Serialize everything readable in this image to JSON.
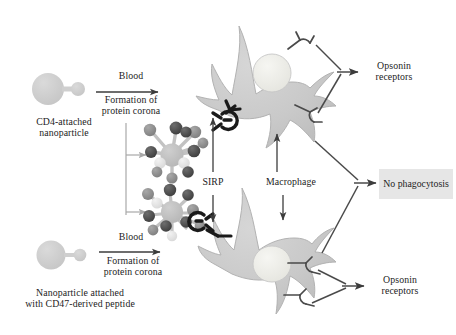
{
  "figure": {
    "background_color": "#ffffff"
  },
  "labels": {
    "cd4_nanoparticle": "CD4-attached\nnanoparticle",
    "cd47_nanoparticle": "Nanoparticle attached\nwith CD47-derived peptide",
    "blood_top": "Blood",
    "corona_top": "Formation of\nprotein corona",
    "blood_bottom": "Blood",
    "corona_bottom": "Formation of\nprotein corona",
    "sirp": "SIRP",
    "macrophage": "Macrophage",
    "opsonin_top": "Opsonin\nreceptors",
    "opsonin_bottom": "Opsonin\nreceptors",
    "no_phagocytosis": "No\nphagocytosis"
  },
  "colors": {
    "cell_fill": "#c9c9c9",
    "cell_stroke": "#b0b0b0",
    "nucleus_fill": "#eeeeea",
    "nucleus_stroke": "#c4c4c0",
    "nanoparticle_fill": "#cfcfcf",
    "receptor_stroke": "#4a4a4a",
    "sirp_stroke": "#1a1a1a",
    "arrow_dark": "#3c3c3c",
    "arrow_light": "#a8a8a8",
    "text": "#1c1c1c",
    "box_fill": "#e6e6e6",
    "corona_dark": "#4a4a4a",
    "corona_mid": "#8f8f8f",
    "corona_light": "#e2e2e2",
    "corona_core": "#c2c2c2"
  },
  "elements": {
    "macrophage_top": "upper macrophage cell with pseudopods and nucleus",
    "macrophage_bottom": "lower macrophage cell with pseudopods and nucleus",
    "corona_cluster_top": "protein corona coated CD4 nanoparticle",
    "corona_cluster_bottom": "protein corona coated CD47-peptide nanoparticle",
    "nanoparticle_top": "bare CD4-attached nanoparticle",
    "nanoparticle_bottom": "bare CD47-peptide nanoparticle"
  }
}
